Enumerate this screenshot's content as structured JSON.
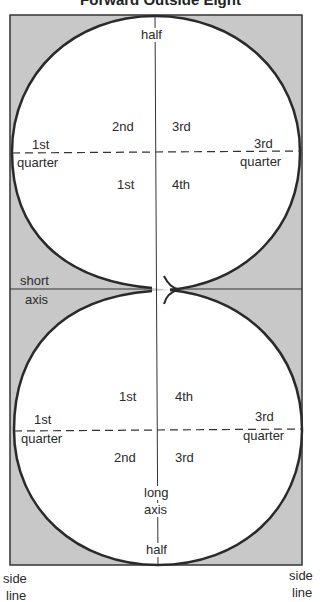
{
  "title": "Forward Outside Eight",
  "colors": {
    "rink_fill": "#c8c8c8",
    "circle_fill": "#ffffff",
    "line": "#2a2a2a"
  },
  "labels": {
    "top_half": "half",
    "bottom_half": "half",
    "short_axis_line1": "short",
    "short_axis_line2": "axis",
    "long_axis_line1": "long",
    "long_axis_line2": "axis",
    "side_line_left_1": "side",
    "side_line_left_2": "line",
    "side_line_right_1": "side",
    "side_line_right_2": "line"
  },
  "top_circle": {
    "quadrants": {
      "upper_left": "2nd",
      "upper_right": "3rd",
      "lower_left": "1st",
      "lower_right": "4th"
    },
    "left_quarter": {
      "line1": "1st",
      "line2": "quarter"
    },
    "right_quarter": {
      "line1": "3rd",
      "line2": "quarter"
    }
  },
  "bottom_circle": {
    "quadrants": {
      "upper_left": "1st",
      "upper_right": "4th",
      "lower_left": "2nd",
      "lower_right": "3rd"
    },
    "left_quarter": {
      "line1": "1st",
      "line2": "quarter"
    },
    "right_quarter": {
      "line1": "3rd",
      "line2": "quarter"
    }
  }
}
